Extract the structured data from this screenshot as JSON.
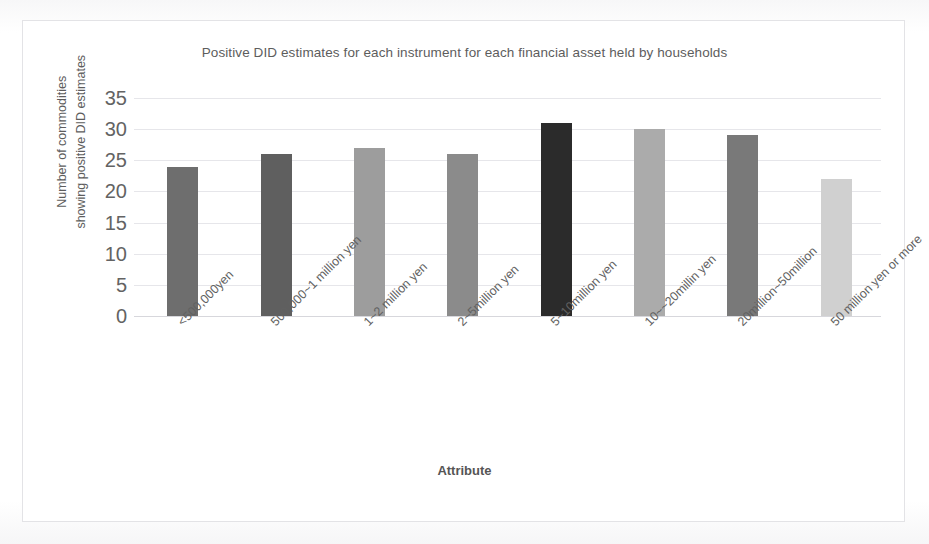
{
  "chart_data": {
    "type": "bar",
    "title": "Positive DID estimates for each instrument for each financial asset held by households",
    "xlabel": "Attribute",
    "ylabel": "Number of commodities showing positive DID estimates",
    "ylabel_lines": [
      "Number of commodities",
      "showing positive DID estimates"
    ],
    "categories": [
      "<500,000yen",
      "500,000~1 million yen",
      "1~2 million yen",
      "2~5million yen",
      "5~10million yen",
      "10~~20millin yen",
      "20million~50million",
      "50 million yen or more"
    ],
    "values": [
      24,
      26,
      27,
      26,
      31,
      30,
      29,
      22
    ],
    "bar_colors": [
      "#6e6e6e",
      "#5f5f5f",
      "#9d9d9d",
      "#8b8b8b",
      "#2b2b2b",
      "#ababab",
      "#797979",
      "#d0d0d0"
    ],
    "ylim": [
      0,
      35
    ],
    "ytick_step": 5,
    "yticks": [
      "35",
      "30",
      "25",
      "20",
      "15",
      "10",
      "5",
      "0"
    ],
    "ytick_values": [
      35,
      30,
      25,
      20,
      15,
      10,
      5,
      0
    ],
    "grid": true,
    "legend": false,
    "legend_position": "none"
  },
  "style": {
    "gridline_color": "#e6e6ea",
    "frame_border_color": "#e3e3e6",
    "title_color": "#5d5d5d",
    "tick_color": "#636363",
    "plot_background": "#ffffff"
  }
}
